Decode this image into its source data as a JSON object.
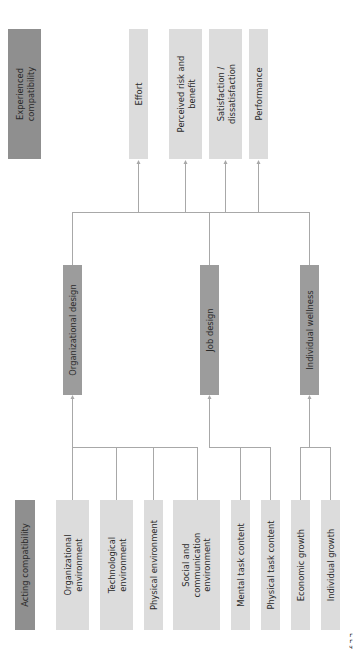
{
  "diagram": {
    "orientation": "rotated-90-ccw",
    "colors": {
      "header_box": "#8f8f8f",
      "design_box": "#9c9c9c",
      "factor_box": "#dcdcdc",
      "connector_line": "#a8a8a8",
      "text": "#2a2a2a"
    },
    "experienced": {
      "header": "Experienced\ncompatibility",
      "outcomes": [
        {
          "label": "Effort"
        },
        {
          "label": "Perceived risk and\nbenefit"
        },
        {
          "label": "Satisfaction /\ndissatisfaction"
        },
        {
          "label": "Performance"
        }
      ]
    },
    "designs": [
      {
        "label": "Organizational design"
      },
      {
        "label": "Job design"
      },
      {
        "label": "Individual wellness"
      }
    ],
    "acting": {
      "header": "Acting compatibility",
      "factors": [
        {
          "label": "Organizational\nenvironment",
          "feeds": "Organizational design"
        },
        {
          "label": "Technological\nenvironment",
          "feeds": "Organizational design"
        },
        {
          "label": "Physical environment",
          "feeds": "Organizational design"
        },
        {
          "label": "Social and\ncommunication\nenvironment",
          "feeds": "Organizational design"
        },
        {
          "label": "Mental task content",
          "feeds": "Job design"
        },
        {
          "label": "Physical task content",
          "feeds": "Job design"
        },
        {
          "label": "Economic growth",
          "feeds": "Individual wellness"
        },
        {
          "label": "Individual growth",
          "feeds": "Individual wellness"
        }
      ]
    },
    "corner_mark": "r r ч"
  }
}
